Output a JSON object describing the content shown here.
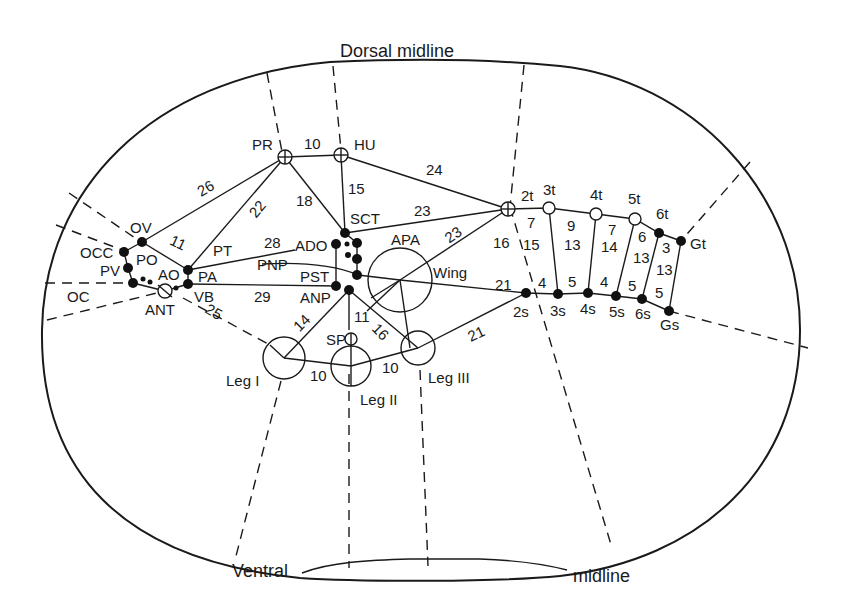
{
  "diagram": {
    "title_top": "Dorsal midline",
    "title_bottom_left": "Ventral",
    "title_bottom_right": "midline",
    "colors": {
      "ink": "#1a1a1a",
      "background": "#ffffff"
    },
    "node_labels": {
      "PR": "PR",
      "HU": "HU",
      "OV": "OV",
      "OCC": "OCC",
      "PO": "PO",
      "PV": "PV",
      "AO": "AO",
      "PA": "PA",
      "OC": "OC",
      "ANT": "ANT",
      "VB": "VB",
      "PT": "PT",
      "SCT": "SCT",
      "ADO": "ADO",
      "PNP": "PNP",
      "PST": "PST",
      "ANP": "ANP",
      "APA": "APA",
      "Wing": "Wing",
      "SP": "SP",
      "LegI": "Leg I",
      "LegII": "Leg II",
      "LegIII": "Leg III",
      "2t": "2t",
      "3t": "3t",
      "4t": "4t",
      "5t": "5t",
      "6t": "6t",
      "Gt": "Gt",
      "2s": "2s",
      "3s": "3s",
      "4s": "4s",
      "5s": "5s",
      "6s": "6s",
      "Gs": "Gs"
    },
    "edge_labels": {
      "PR_HU": "10",
      "OV_PR": "26",
      "PA_PR": "22",
      "PR_SCT": "18",
      "HU_SCT": "15",
      "HU_2t": "24",
      "SCT_2t": "23",
      "APA_2t": "23",
      "OV_PA": "11",
      "PT_ADO": "28",
      "VB_ANP": "29",
      "ANT_LegI": "25",
      "ANP_LegI": "14",
      "ANP_SP": "11",
      "ANP_LegIII": "16",
      "LegI_LegII": "10",
      "LegII_LegIII": "10",
      "LegIII_2s": "21",
      "Wing_2s": "21",
      "2t_2s": "16",
      "2t_3t": "7",
      "2_3_mid": "15",
      "2s_3s": "4",
      "3t_4t": "9",
      "3_4_mid": "13",
      "3s_4s": "5",
      "4t_5t": "7",
      "4_5_mid": "14",
      "4s_5s": "4",
      "5t_6t": "6",
      "5_6_mid": "13",
      "5s_6s": "5",
      "6t_Gt": "3",
      "6_G_mid": "13",
      "6s_Gs": "5"
    }
  }
}
